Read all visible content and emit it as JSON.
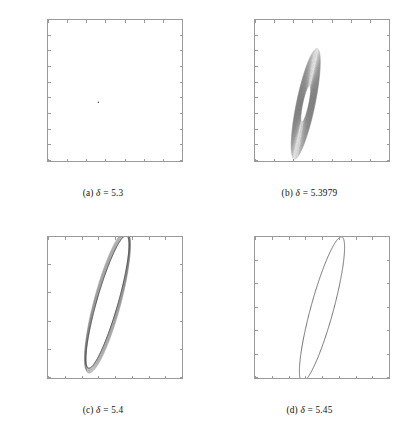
{
  "figure": {
    "type": "phase-portrait-grid",
    "rows": 2,
    "columns": 2,
    "axis_label_x": "x",
    "axis_label_y": "y",
    "line_color": "#555555",
    "axis_color": "#9a9a9a"
  },
  "chart_data": [
    {
      "id": "panel-a",
      "type": "scatter",
      "title": "",
      "caption": "(a)  δ = 5.3",
      "caption_prefix": "(a)",
      "caption_symbol": "δ",
      "caption_value": "5.3",
      "parameter": "δ",
      "parameter_value": 5.3,
      "xlabel": "x",
      "ylabel": "y",
      "xlim": [
        1.58,
        1.65
      ],
      "ylim": [
        2.132,
        2.15
      ],
      "grid": false,
      "legend": "none",
      "xticks": [
        1.58,
        1.59,
        1.6,
        1.61,
        1.62,
        1.63,
        1.64,
        1.65
      ],
      "xticklabels": [
        "1.58",
        "1.59",
        "1.6",
        "1.61",
        "1.62",
        "1.63",
        "1.64",
        "1.65"
      ],
      "yticks": [
        2.132,
        2.134,
        2.136,
        2.138,
        2.14,
        2.142,
        2.144,
        2.146,
        2.148,
        2.15
      ],
      "yticklabels": [
        "2.132",
        "2.134",
        "2.136",
        "2.138",
        "2.14",
        "2.142",
        "2.144",
        "2.146",
        "2.148",
        "2.15"
      ],
      "description": "Stable focus: trajectory collapses to a single fixed point.",
      "points": [
        [
          1.6063,
          2.1395
        ]
      ],
      "series": [
        {
          "name": "fixed-point",
          "x": [
            1.6063
          ],
          "y": [
            2.1395
          ]
        }
      ]
    },
    {
      "id": "panel-b",
      "type": "scatter",
      "title": "",
      "caption": "(b)  δ = 5.3979",
      "caption_prefix": "(b)",
      "caption_symbol": "δ",
      "caption_value": "5.3979",
      "parameter": "δ",
      "parameter_value": 5.3979,
      "xlabel": "x",
      "ylabel": "y",
      "xlim": [
        1.58,
        1.65
      ],
      "ylim": [
        2.132,
        2.15
      ],
      "grid": false,
      "legend": "none",
      "xticks": [
        1.58,
        1.59,
        1.6,
        1.61,
        1.62,
        1.63,
        1.64,
        1.65
      ],
      "xticklabels": [
        "1.58",
        "1.59",
        "1.6",
        "1.61",
        "1.62",
        "1.63",
        "1.64",
        "1.65"
      ],
      "yticks": [
        2.132,
        2.134,
        2.136,
        2.138,
        2.14,
        2.142,
        2.144,
        2.146,
        2.148,
        2.15
      ],
      "yticklabels": [
        "2.132",
        "2.134",
        "2.136",
        "2.138",
        "2.14",
        "2.142",
        "2.144",
        "2.146",
        "2.148",
        "2.15"
      ],
      "description": "Slowly unwinding spiral near the Hopf bifurcation; dense annulus of orbit points tilted about 45 degrees, with an empty elliptical core at the centre.",
      "spiral": {
        "center_x": 1.6065,
        "center_y": 2.1393,
        "tilt_deg": 42,
        "r_inner_semi_major": 0.0032,
        "r_inner_semi_minor": 0.0011,
        "r_outer_semi_major": 0.0098,
        "r_outer_semi_minor": 0.0036,
        "turns": 62
      }
    },
    {
      "id": "panel-c",
      "type": "line",
      "title": "",
      "caption": "(c)  δ = 5.4",
      "caption_prefix": "(c)",
      "caption_symbol": "δ",
      "caption_value": "5.4",
      "parameter": "δ",
      "parameter_value": 5.4,
      "xlabel": "x",
      "ylabel": "y",
      "xlim": [
        1.57,
        1.65
      ],
      "ylim": [
        2.125,
        2.15
      ],
      "grid": false,
      "legend": "none",
      "xticks": [
        1.57,
        1.58,
        1.59,
        1.6,
        1.61,
        1.62,
        1.63,
        1.64,
        1.65
      ],
      "xticklabels": [
        "1.57",
        "1.58",
        "1.59",
        "1.6",
        "1.61",
        "1.62",
        "1.63",
        "1.64",
        "1.65"
      ],
      "yticks": [
        2.125,
        2.13,
        2.135,
        2.14,
        2.145,
        2.15
      ],
      "yticklabels": [
        "2.125",
        "2.13",
        "2.135",
        "2.14",
        "2.145",
        "2.15"
      ],
      "description": "Stable limit cycle: large tilted ellipse with a thin spiral fringe of transient points on its outside.",
      "cycle": {
        "center_x": 1.6055,
        "center_y": 2.1385,
        "tilt_deg": 42,
        "semi_major": 0.0168,
        "semi_minor": 0.0046,
        "fringe": true
      }
    },
    {
      "id": "panel-d",
      "type": "line",
      "title": "",
      "caption": "(d)  δ = 5.45",
      "caption_prefix": "(d)",
      "caption_symbol": "δ",
      "caption_value": "5.45",
      "parameter": "δ",
      "parameter_value": 5.45,
      "xlabel": "x",
      "ylabel": "y",
      "xlim": [
        1.4,
        1.8
      ],
      "ylim": [
        2.08,
        2.2
      ],
      "grid": false,
      "legend": "none",
      "xticks": [
        1.4,
        1.45,
        1.5,
        1.55,
        1.6,
        1.65,
        1.7,
        1.75,
        1.8
      ],
      "xticklabels": [
        "1.4",
        "1.45",
        "1.5",
        "1.55",
        "1.6",
        "1.65",
        "1.7",
        "1.75",
        "1.8"
      ],
      "yticks": [
        2.08,
        2.1,
        2.12,
        2.14,
        2.16,
        2.18,
        2.2
      ],
      "yticklabels": [
        "2.08",
        "2.1",
        "2.12",
        "2.14",
        "2.16",
        "2.18",
        "2.2"
      ],
      "description": "Fully grown limit cycle drawn as a single smooth closed curve, tilted ellipse with no visible transient.",
      "cycle": {
        "center_x": 1.6,
        "center_y": 2.1385,
        "tilt_deg": 42,
        "semi_major": 0.088,
        "semi_minor": 0.0245,
        "fringe": false
      }
    }
  ]
}
